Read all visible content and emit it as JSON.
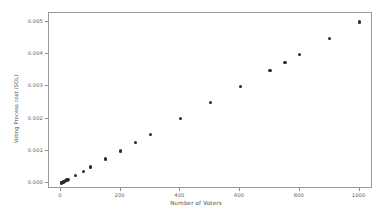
{
  "chart_data": {
    "type": "scatter",
    "title": "",
    "xlabel": "Number of Voters",
    "ylabel": "Voting Process cost (SOL)",
    "xlim": [
      -40,
      1045
    ],
    "ylim": [
      -0.00018,
      0.00528
    ],
    "grid": false,
    "legend": null,
    "xticks": [
      0,
      200,
      400,
      600,
      800,
      1000
    ],
    "xticklabels": [
      "0",
      "200",
      "400",
      "600",
      "800",
      "1000"
    ],
    "yticks": [
      0.0,
      0.001,
      0.002,
      0.003,
      0.004,
      0.005
    ],
    "yticklabels": [
      "0.000",
      "0.001",
      "0.002",
      "0.003",
      "0.004",
      "0.005"
    ],
    "marker": "circle",
    "marker_color": "#2b2b2b",
    "series": [
      {
        "name": "Voting Process cost",
        "x": [
          1,
          2,
          3,
          4,
          5,
          6,
          8,
          10,
          12,
          15,
          20,
          25,
          50,
          75,
          100,
          150,
          200,
          250,
          300,
          400,
          500,
          600,
          700,
          750,
          800,
          900,
          1000
        ],
        "y": [
          5e-06,
          1e-05,
          1.5e-05,
          2e-05,
          2.5e-05,
          3e-05,
          4e-05,
          5e-05,
          6e-05,
          7.5e-05,
          0.0001,
          0.000125,
          0.00025,
          0.000375,
          0.0005,
          0.00075,
          0.001,
          0.00125,
          0.0015,
          0.002,
          0.0025,
          0.003,
          0.0035,
          0.00375,
          0.004,
          0.0045,
          0.005
        ]
      }
    ]
  }
}
